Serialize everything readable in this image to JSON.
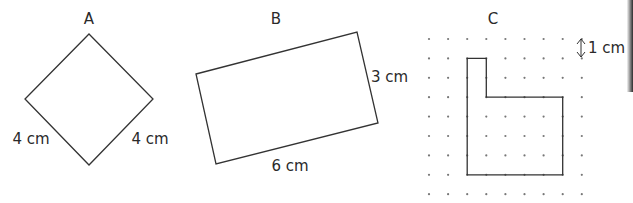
{
  "figures": [
    {
      "id": "A",
      "label": "A",
      "shape": "square (rotated 45°)",
      "side_labels": [
        "4 cm",
        "4 cm"
      ],
      "points": [
        [
          89,
          34
        ],
        [
          153,
          99
        ],
        [
          89,
          165
        ],
        [
          25,
          99
        ]
      ]
    },
    {
      "id": "B",
      "label": "B",
      "shape": "rectangle (tilted)",
      "side_labels": [
        "3 cm",
        "6 cm"
      ],
      "points": [
        [
          196,
          74
        ],
        [
          357,
          32
        ],
        [
          378,
          123
        ],
        [
          216,
          164
        ]
      ]
    },
    {
      "id": "C",
      "label": "C",
      "shape": "L-shaped rectilinear polygon on dot grid",
      "grid_scale_label": "1 cm",
      "grid": {
        "cols": 9,
        "rows": 9,
        "x0": 429,
        "y0": 39,
        "dx": 19.1,
        "dy": 19.4
      },
      "grid_path": [
        [
          2,
          1
        ],
        [
          3,
          1
        ],
        [
          3,
          3
        ],
        [
          7,
          3
        ],
        [
          7,
          7
        ],
        [
          2,
          7
        ]
      ]
    }
  ],
  "labels": {
    "a_title": "A",
    "a_left_side": "4 cm",
    "a_right_side": "4 cm",
    "b_title": "B",
    "b_short_side": "3 cm",
    "b_long_side": "6 cm",
    "c_title": "C",
    "c_scale": "1 cm"
  },
  "colors": {
    "stroke": "#333333",
    "dot": "#777777",
    "text": "#2a2a2a"
  }
}
